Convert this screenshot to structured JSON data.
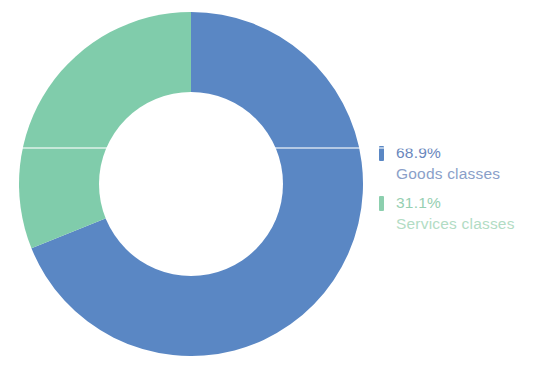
{
  "chart_data": {
    "type": "pie",
    "variant": "donut",
    "title": "",
    "subtitle": "",
    "xlabel": "",
    "ylabel": "",
    "grid": false,
    "legend_position": "right",
    "start_angle_deg": 0,
    "direction": "clockwise",
    "units": "percent",
    "total": 100,
    "categories": [
      "Goods classes",
      "Services classes"
    ],
    "values": [
      68.9,
      31.1
    ],
    "value_labels": [
      "68.9%",
      "31.1%"
    ],
    "colors": [
      "#5a87c4",
      "#80ccab"
    ],
    "slices": [
      {
        "name": "Goods classes",
        "value": 68.9,
        "value_label": "68.9%",
        "color": "#5a87c4",
        "sweep_deg": 248.04,
        "start_deg": 0,
        "end_deg": 248.04
      },
      {
        "name": "Services classes",
        "value": 31.1,
        "value_label": "31.1%",
        "color": "#80ccab",
        "sweep_deg": 111.96,
        "start_deg": 248.04,
        "end_deg": 360
      }
    ]
  },
  "legend": {
    "items": [
      {
        "value_label": "68.9%",
        "name": "Goods classes",
        "swatch_color": "#5a87c4"
      },
      {
        "value_label": "31.1%",
        "name": "Services classes",
        "swatch_color": "#8ccfae"
      }
    ]
  }
}
